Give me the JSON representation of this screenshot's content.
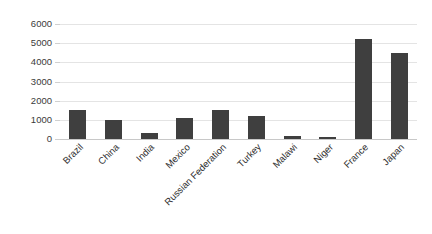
{
  "chart_data": {
    "type": "bar",
    "title": "",
    "subtitle": "",
    "xlabel": "",
    "ylabel": "",
    "categories": [
      "Brazil",
      "China",
      "India",
      "Mexico",
      "Russian Federation",
      "Turkey",
      "Malawi",
      "Niger",
      "France",
      "Japan"
    ],
    "values": [
      1500,
      980,
      320,
      1080,
      1500,
      1200,
      150,
      100,
      5200,
      4500
    ],
    "series": [
      {
        "name": "",
        "values": [
          1500,
          980,
          320,
          1080,
          1500,
          1200,
          150,
          100,
          5200,
          4500
        ]
      }
    ],
    "ylim": [
      0,
      6000
    ],
    "y_ticks": [
      0,
      1000,
      2000,
      3000,
      4000,
      5000,
      6000
    ],
    "y_tick_labels": [
      "0",
      "1000",
      "2000",
      "3000",
      "4000",
      "5000",
      "6000"
    ],
    "grid": true,
    "grid_axis": "y",
    "legend": false,
    "legend_position": "none",
    "bar_color": "#3f3f3f",
    "gridline_color": "#e4e4e4",
    "background_color": "#ffffff",
    "x_label_rotation": -45,
    "annotations": []
  }
}
